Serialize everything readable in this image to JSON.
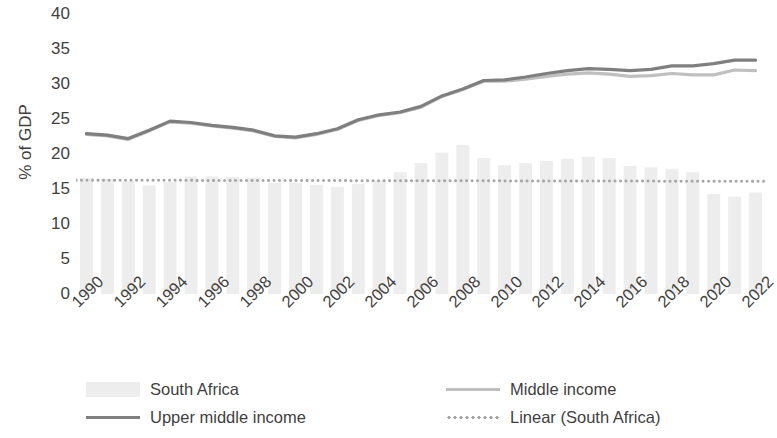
{
  "chart_data": {
    "type": "bar",
    "title": "",
    "subtitle": "",
    "xlabel": "",
    "ylabel": "% of GDP",
    "ylim": [
      0,
      40
    ],
    "ytick_step": 5,
    "yticks": [
      40,
      35,
      30,
      25,
      20,
      15,
      10,
      5,
      0
    ],
    "grid": false,
    "legend_position": "bottom",
    "x": [
      1990,
      1991,
      1992,
      1993,
      1994,
      1995,
      1996,
      1997,
      1998,
      1999,
      2000,
      2001,
      2002,
      2003,
      2004,
      2005,
      2006,
      2007,
      2008,
      2009,
      2010,
      2011,
      2012,
      2013,
      2014,
      2015,
      2016,
      2017,
      2018,
      2019,
      2020,
      2021,
      2022
    ],
    "xtick_labels": [
      "1990",
      "1992",
      "1994",
      "1996",
      "1998",
      "2000",
      "2002",
      "2004",
      "2006",
      "2008",
      "2010",
      "2012",
      "2014",
      "2016",
      "2018",
      "2020",
      "2022"
    ],
    "series": [
      {
        "name": "South Africa",
        "kind": "bar",
        "color": "#ededed",
        "values": [
          16.6,
          16.4,
          16.1,
          15.5,
          16.0,
          16.8,
          16.8,
          16.7,
          16.6,
          15.9,
          15.9,
          15.6,
          15.3,
          15.7,
          16.2,
          17.4,
          18.7,
          20.2,
          21.3,
          19.4,
          18.4,
          18.7,
          19.0,
          19.3,
          19.6,
          19.4,
          18.3,
          18.1,
          17.9,
          17.4,
          14.3,
          13.9,
          14.5
        ]
      },
      {
        "name": "Upper middle income",
        "kind": "line",
        "color": "#7f7f7f",
        "values": [
          22.9,
          22.7,
          22.2,
          23.4,
          24.7,
          24.5,
          24.1,
          23.8,
          23.4,
          22.6,
          22.4,
          22.9,
          23.6,
          24.9,
          25.6,
          26.0,
          26.8,
          28.3,
          29.3,
          30.5,
          30.6,
          31.0,
          31.5,
          31.9,
          32.2,
          32.1,
          31.9,
          32.1,
          32.6,
          32.6,
          32.9,
          33.4,
          33.4
        ]
      },
      {
        "name": "Middle income",
        "kind": "line",
        "color": "#bfbfbf",
        "values": [
          22.8,
          22.6,
          22.1,
          23.3,
          24.6,
          24.4,
          24.0,
          23.7,
          23.3,
          22.5,
          22.3,
          22.8,
          23.5,
          24.8,
          25.5,
          25.9,
          26.7,
          28.2,
          29.2,
          30.4,
          30.4,
          30.7,
          31.1,
          31.4,
          31.6,
          31.4,
          31.1,
          31.2,
          31.5,
          31.3,
          31.3,
          32.0,
          31.9
        ]
      },
      {
        "name": "Linear (South Africa)",
        "kind": "dotted-trendline",
        "color": "#a6a6a6",
        "values": [
          16.26,
          16.25,
          16.25,
          16.24,
          16.24,
          16.23,
          16.23,
          16.22,
          16.22,
          16.21,
          16.21,
          16.2,
          16.2,
          16.19,
          16.19,
          16.18,
          16.18,
          16.17,
          16.17,
          16.16,
          16.16,
          16.15,
          16.15,
          16.14,
          16.14,
          16.13,
          16.13,
          16.12,
          16.12,
          16.11,
          16.11,
          16.1,
          16.1
        ]
      }
    ]
  },
  "axis": {
    "y_title": "% of GDP"
  },
  "legend": {
    "items": [
      {
        "label": "South Africa",
        "marker": "bar-swatch",
        "color": "#ededed"
      },
      {
        "label": "Middle income",
        "marker": "line-swatch",
        "color": "#bfbfbf"
      },
      {
        "label": "Upper middle income",
        "marker": "line-swatch",
        "color": "#7f7f7f"
      },
      {
        "label": "Linear (South Africa)",
        "marker": "dotted-swatch",
        "color": "#a6a6a6"
      }
    ]
  }
}
